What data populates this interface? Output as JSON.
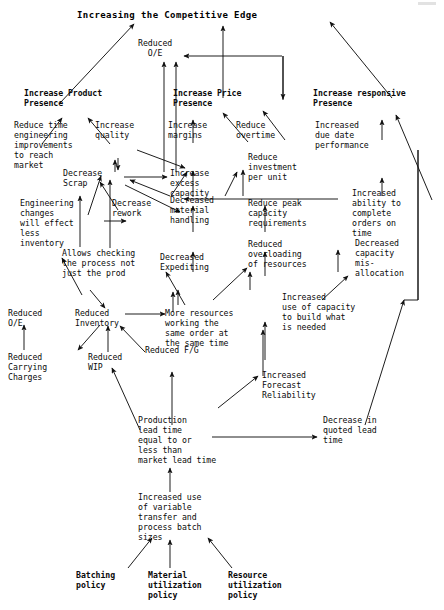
{
  "diagram": {
    "type": "causal-flow-diagram",
    "title": "Increasing the Competitive Edge",
    "nodes": {
      "title": "Increasing the Competitive Edge",
      "reduced_oe_top": "Reduced\nO/E",
      "increase_product_presence": "Increase Product\nPresence",
      "increase_price_presence": "Increase Price\nPresence",
      "increase_responsive_presence": "Increase responsive\nPresence",
      "reduce_time_engineering": "Reduce time\nengineering\nimprovements\nto reach\nmarket",
      "increase_quality": "Increase\nquality",
      "increase_margins": "Increase\nmargins",
      "reduce_overtime": "Reduce\novertime",
      "increased_due_date": "Increased\ndue date\nperformance",
      "decrease_scrap": "Decrease\nScrap",
      "increase_excess_capacity": "Increase\nexcess\ncapacity",
      "reduce_investment": "Reduce\ninvestment\nper unit",
      "engineering_changes": "Engineering\nchanges\nwill effect\nless\ninventory",
      "decrease_rework": "Decrease\nrework",
      "decreased_material_handling": "Decreased\nmaterial\nhandling",
      "reduce_peak_capacity": "Reduce peak\ncapacity\nrequirements",
      "increased_ability": "Increased\nability to\ncomplete\norders on\ntime",
      "allows_checking": "Allows checking\nthe process not\njust the prod",
      "decreased_expediting": "Decreased\nExpediting",
      "reduced_overloading": "Reduced\noverloading\nof resources",
      "decreased_capacity_misallocation": "Decreased\ncapacity\nmis-\nallocation",
      "reduced_oe_bottom": "Reduced\nO/E",
      "reduced_inventory": "Reduced\nInventory",
      "more_resources": "More resources\nworking the\nsame order at\nthe same time",
      "increased_use_capacity": "Increased\nuse of capacity\nto build what\nis needed",
      "reduced_carrying_charges": "Reduced\nCarrying\nCharges",
      "reduced_wip": "Reduced\nWIP",
      "reduced_fg": "Reduced F/G",
      "increased_forecast_reliability": "Increased\nForecast\nReliability",
      "production_lead_time": "Production\nlead time\nequal to or\nless than\nmarket lead time",
      "decrease_quoted_lead_time": "Decrease in\nquoted lead\ntime",
      "increased_use_variable": "Increased use\nof variable\ntransfer and\nprocess batch\nsizes",
      "batching_policy": "Batching\npolicy",
      "material_utilization_policy": "Material\nutilization\npolicy",
      "resource_utilization_policy": "Resource\nutilization\npolicy"
    },
    "colors": {
      "background": "#ffffff",
      "text": "#0a0a0a",
      "arrow": "#111111"
    }
  }
}
